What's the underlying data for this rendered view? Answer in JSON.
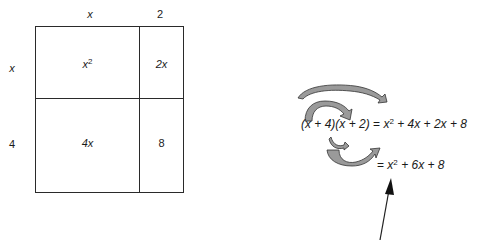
{
  "area_model": {
    "top_labels": [
      "x",
      "2"
    ],
    "side_labels": [
      "x",
      "4"
    ],
    "cells": {
      "top_left": {
        "base": "x",
        "exp": "2"
      },
      "top_right": "2x",
      "bottom_left": "4x",
      "bottom_right": "8"
    }
  },
  "foil": {
    "line1": {
      "lhs": "(x + 4)(x + 2)",
      "eq": "=",
      "term1_base": "x",
      "term1_exp": "2",
      "rest": "+ 4x + 2x + 8"
    },
    "line2": {
      "eq": "=",
      "term1_base": "x",
      "term1_exp": "2",
      "rest": "+ 6x + 8"
    }
  },
  "colors": {
    "line": "#2a2a2a",
    "arrow_fill": "#9a9a9a",
    "background": "#ffffff"
  }
}
